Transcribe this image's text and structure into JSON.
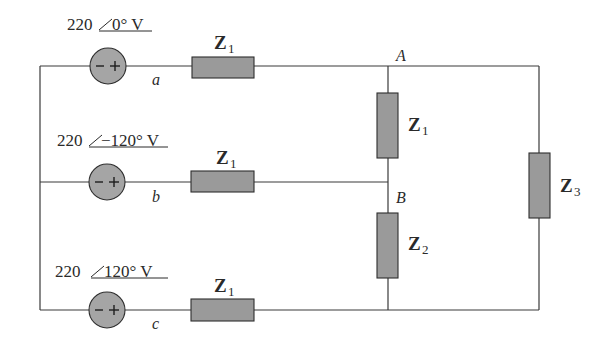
{
  "diagram": {
    "type": "three-phase circuit",
    "sources": [
      {
        "id": "a",
        "magnitude": "220",
        "angle": "0°",
        "unit": "V",
        "label": "220",
        "phase_text": "0° V",
        "node": "a"
      },
      {
        "id": "b",
        "magnitude": "220",
        "angle": "-120°",
        "unit": "V",
        "label": "220",
        "phase_text": "−120° V",
        "node": "b"
      },
      {
        "id": "c",
        "magnitude": "220",
        "angle": "120°",
        "unit": "V",
        "label": "220",
        "phase_text": "120° V",
        "node": "c"
      }
    ],
    "source_polarity": {
      "minus": "−",
      "plus": "+"
    },
    "impedances": [
      {
        "id": "z1-line-a",
        "name": "Z",
        "subscript": "1"
      },
      {
        "id": "z1-line-b",
        "name": "Z",
        "subscript": "1"
      },
      {
        "id": "z1-line-c",
        "name": "Z",
        "subscript": "1"
      },
      {
        "id": "z1-load-AB",
        "name": "Z",
        "subscript": "1"
      },
      {
        "id": "z2-load-B",
        "name": "Z",
        "subscript": "2"
      },
      {
        "id": "z3-load",
        "name": "Z",
        "subscript": "3"
      }
    ],
    "nodes": {
      "A": "A",
      "B": "B"
    },
    "colors": {
      "component_fill": "#9a9a9a",
      "wire": "#3a3a3a",
      "background": "#ffffff"
    }
  }
}
